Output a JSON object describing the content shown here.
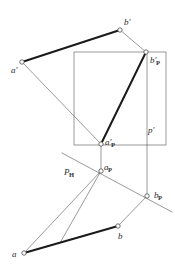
{
  "figure": {
    "type": "technical-line-drawing",
    "width": 175,
    "height": 273,
    "background_color": "#ffffff",
    "thin_line_color": "#6e6e6e",
    "thick_line_color": "#1a1a1a",
    "vertex_fill_color": "#ffffff",
    "vertex_stroke_color": "#4a4a4a",
    "label_color": "#2b2b2b",
    "thin_line_width": 0.7,
    "thick_line_width": 2.0
  },
  "labels": [
    {
      "id": "a-prime",
      "text": "a",
      "subscript": "",
      "prime": "′",
      "x": 11,
      "y": 66
    },
    {
      "id": "b-prime",
      "text": "b",
      "subscript": "",
      "prime": "′",
      "x": 124,
      "y": 18
    },
    {
      "id": "b-prime-p",
      "text": "b",
      "subscript": "P",
      "prime": "′",
      "x": 150,
      "y": 56
    },
    {
      "id": "a-prime-p",
      "text": "a",
      "subscript": "P",
      "prime": "′",
      "x": 105,
      "y": 138
    },
    {
      "id": "p-prime",
      "text": "p",
      "subscript": "",
      "prime": "′",
      "x": 148,
      "y": 126
    },
    {
      "id": "p-h",
      "text": "P",
      "subscript": "H",
      "prime": "",
      "x": 64,
      "y": 168
    },
    {
      "id": "a-p",
      "text": "a",
      "subscript": "P",
      "prime": "",
      "x": 104,
      "y": 163
    },
    {
      "id": "b-p",
      "text": "b",
      "subscript": "P",
      "prime": "",
      "x": 154,
      "y": 191
    },
    {
      "id": "b-plan",
      "text": "b",
      "subscript": "",
      "prime": "",
      "x": 118,
      "y": 232
    },
    {
      "id": "a-plan",
      "text": "a",
      "subscript": "",
      "prime": "",
      "x": 12,
      "y": 250
    }
  ],
  "points": [
    {
      "id": "a-prime-pt",
      "name": "a-prime-vertex",
      "x": 22,
      "y": 62
    },
    {
      "id": "b-prime-pt",
      "name": "b-prime-vertex",
      "x": 120,
      "y": 30
    },
    {
      "id": "b-prime-p-pt",
      "name": "b-prime-p-vertex",
      "x": 146,
      "y": 52
    },
    {
      "id": "a-prime-p-pt",
      "name": "a-prime-p-vertex",
      "x": 101,
      "y": 144
    },
    {
      "id": "a-p-pt",
      "name": "a-p-vertex",
      "x": 101,
      "y": 171
    },
    {
      "id": "b-p-pt",
      "name": "b-p-vertex",
      "x": 147,
      "y": 196
    },
    {
      "id": "b-plan-pt",
      "name": "b-plan-vertex",
      "x": 118,
      "y": 226
    },
    {
      "id": "a-plan-pt",
      "name": "a-plan-vertex",
      "x": 24,
      "y": 253
    }
  ],
  "rectangle": {
    "name": "auxiliary-plane-rectangle",
    "x1": 74,
    "y1": 52,
    "x2": 166,
    "y2": 145,
    "inner_vertical_x": 147
  },
  "thick_segments": [
    {
      "name": "frontal-projection-ab",
      "x1": 22,
      "y1": 62,
      "x2": 120,
      "y2": 30
    },
    {
      "name": "frontal-trace-segment",
      "x1": 101,
      "y1": 144,
      "x2": 146,
      "y2": 52
    },
    {
      "name": "horizontal-projection-ab",
      "x1": 24,
      "y1": 253,
      "x2": 118,
      "y2": 226
    }
  ],
  "thin_segments": [
    {
      "name": "a-prime-to-a-prime-p",
      "x1": 22,
      "y1": 62,
      "x2": 101,
      "y2": 144
    },
    {
      "name": "b-prime-to-b-prime-p",
      "x1": 120,
      "y1": 30,
      "x2": 146,
      "y2": 52
    },
    {
      "name": "projector-a",
      "x1": 101,
      "y1": 144,
      "x2": 101,
      "y2": 171
    },
    {
      "name": "projector-p",
      "x1": 147,
      "y1": 145,
      "x2": 147,
      "y2": 196
    },
    {
      "name": "trace-ph",
      "x1": 62,
      "y1": 153,
      "x2": 172,
      "y2": 212
    },
    {
      "name": "a-p-to-a-plan",
      "x1": 101,
      "y1": 171,
      "x2": 24,
      "y2": 253
    },
    {
      "name": "a-p-to-b-p-lower",
      "x1": 101,
      "y1": 171,
      "x2": 60,
      "y2": 243
    },
    {
      "name": "b-p-to-b-plan",
      "x1": 147,
      "y1": 196,
      "x2": 118,
      "y2": 226
    }
  ]
}
